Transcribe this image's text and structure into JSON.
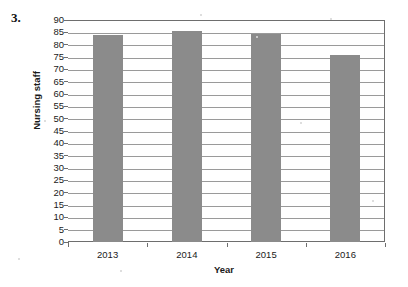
{
  "question_number": "3.",
  "chart_data": {
    "type": "bar",
    "title": "",
    "categories": [
      "2013",
      "2014",
      "2015",
      "2016"
    ],
    "values": [
      84,
      85.5,
      84.5,
      76
    ],
    "series": [
      {
        "name": "Nursing staff",
        "values": [
          84,
          85.5,
          84.5,
          76
        ]
      }
    ],
    "xlabel": "Year",
    "ylabel": "Nursing staff",
    "ylim": [
      0,
      90
    ],
    "ytick_step": 5,
    "yticks": [
      0,
      5,
      10,
      15,
      20,
      25,
      30,
      35,
      40,
      45,
      50,
      55,
      60,
      65,
      70,
      75,
      80,
      85,
      90
    ],
    "ytick_labels": [
      "0",
      "5",
      "10",
      "15",
      "20",
      "25",
      "30",
      "35",
      "40",
      "45",
      "50",
      "55",
      "60",
      "65",
      "70",
      "75",
      "80",
      "85",
      "90"
    ],
    "grid": true,
    "legend": "none",
    "bar_color": "#8b8b8b",
    "axis_color": "#6e6e6e",
    "grid_color": "#9a9a9a"
  }
}
